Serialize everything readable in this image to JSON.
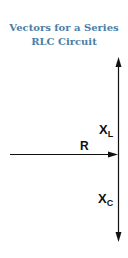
{
  "title": {
    "line1": "Vectors for a Series",
    "line2": "RLC Circuit"
  },
  "vectors": {
    "inductive": {
      "main": "X",
      "sub": "L",
      "direction": "up"
    },
    "resistive": {
      "label": "R",
      "direction": "right"
    },
    "capacitive": {
      "main": "X",
      "sub": "C",
      "direction": "down"
    }
  },
  "colors": {
    "title": "#4a7ea6",
    "vector": "#111111"
  }
}
